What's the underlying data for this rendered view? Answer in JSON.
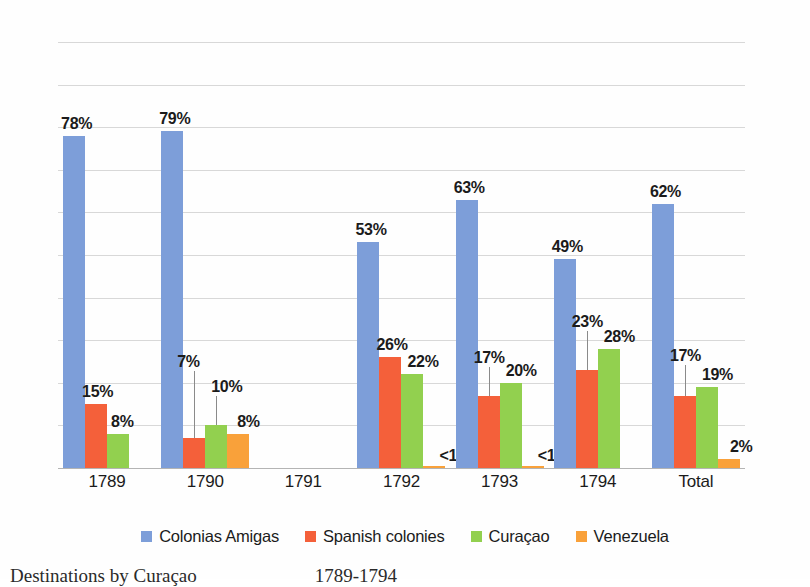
{
  "chart_data": {
    "type": "bar",
    "title": "",
    "subtitle": "",
    "xlabel": "",
    "ylabel": "",
    "ylim": [
      0,
      100
    ],
    "yticks": [
      0,
      10,
      20,
      30,
      40,
      50,
      60,
      70,
      80,
      90,
      100
    ],
    "ytick_labels": [
      "0",
      "10",
      "20",
      "30",
      "40",
      "50",
      "60",
      "70",
      "80",
      "90",
      "100"
    ],
    "grid": true,
    "legend_position": "bottom",
    "categories": [
      "1789",
      "1790",
      "1791",
      "1792",
      "1793",
      "1794",
      "Total"
    ],
    "series": [
      {
        "name": "Colonias Amigas",
        "color": "#7d9ed9",
        "values": [
          78,
          79,
          null,
          53,
          63,
          49,
          62
        ],
        "labels": [
          "78%",
          "79%",
          "",
          "53%",
          "63%",
          "49%",
          "62%"
        ]
      },
      {
        "name": "Spanish colonies",
        "color": "#f4603a",
        "values": [
          15,
          7,
          null,
          26,
          17,
          23,
          17
        ],
        "labels": [
          "15%",
          "7%",
          "",
          "26%",
          "17%",
          "23%",
          "17%"
        ]
      },
      {
        "name": "Curaçao",
        "color": "#92d04f",
        "values": [
          8,
          10,
          null,
          22,
          20,
          28,
          19
        ],
        "labels": [
          "8%",
          "10%",
          "",
          "22%",
          "20%",
          "28%",
          "19%"
        ]
      },
      {
        "name": "Venezuela",
        "color": "#f9a13a",
        "values": [
          null,
          8,
          null,
          0.4,
          0.4,
          null,
          2
        ],
        "labels": [
          "",
          "8%",
          "",
          "<1%",
          "<1%",
          "",
          "2%"
        ]
      }
    ],
    "annotations": [
      "Leader lines connect the 7% and 10% labels to the 1790 Spanish-colonies and Curacao bars",
      "Leader lines connect the 17% label to the 1793 Spanish-colonies bar",
      "Leader lines connect the 23% label to the 1794 Spanish-colonies bar",
      "Leader lines connect the 17% label to the Total Spanish-colonies bar",
      "1791 has no data bars"
    ]
  },
  "axis": {
    "yticks": [
      "100",
      "90",
      "80",
      "70",
      "60",
      "50",
      "40",
      "30",
      "20",
      "10",
      "0"
    ],
    "xlabels": [
      "1789",
      "1790",
      "1791",
      "1792",
      "1793",
      "1794",
      "Total"
    ]
  },
  "legend": {
    "items": [
      {
        "label": "Colonias Amigas",
        "color": "#7d9ed9"
      },
      {
        "label": "Spanish colonies",
        "color": "#f4603a"
      },
      {
        "label": "Curaçao",
        "color": "#92d04f"
      },
      {
        "label": "Venezuela",
        "color": "#f9a13a"
      }
    ]
  },
  "caption": {
    "text": "Destinations by Curaçao",
    "range": "1789-1794"
  },
  "colors": {
    "colonias_amigas": "#7d9ed9",
    "spanish_colonies": "#f4603a",
    "curacao": "#92d04f",
    "venezuela": "#f9a13a",
    "gridline": "#d8d8d8",
    "axis": "#b4b4b4",
    "text": "#1b1b1b",
    "background": "#fefefe"
  }
}
